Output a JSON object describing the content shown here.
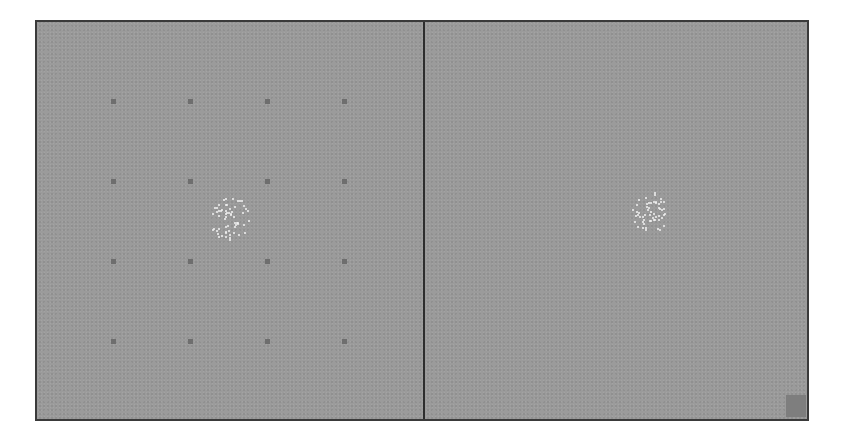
{
  "display": {
    "background_color": "#9b9b9b",
    "border_color": "#3a3a3a",
    "marker_color": "#6e6e6e",
    "dot_color": "#f2f2f2",
    "cue_color": "#7e7e7e"
  },
  "left_panel": {
    "grid_markers": {
      "columns": [
        76,
        153,
        230,
        307
      ],
      "rows": [
        79,
        159,
        239,
        319
      ]
    },
    "dot_cluster": {
      "center_x": 192,
      "center_y": 196,
      "radius_x": 20,
      "radius_y": 22,
      "count": 60
    }
  },
  "right_panel": {
    "dot_cluster": {
      "center_x": 224,
      "center_y": 190,
      "radius_x": 18,
      "radius_y": 21,
      "count": 55
    },
    "corner_cue": {
      "x": 361,
      "y": 373
    }
  }
}
